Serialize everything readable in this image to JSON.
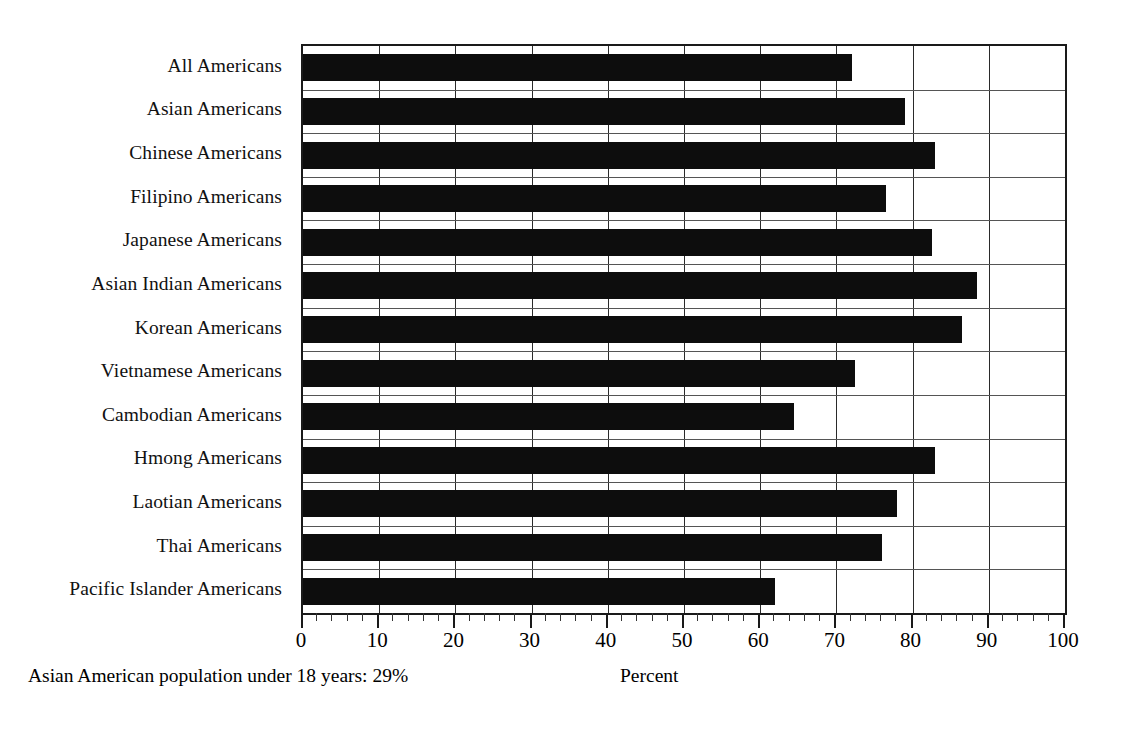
{
  "chart_data": {
    "type": "bar",
    "orientation": "horizontal",
    "title": "",
    "xlabel": "Percent",
    "ylabel": "",
    "xlim": [
      0,
      100
    ],
    "xticks": [
      0,
      10,
      20,
      30,
      40,
      50,
      60,
      70,
      80,
      90,
      100
    ],
    "xtick_labels": [
      "0",
      "10",
      "20",
      "30",
      "40",
      "50",
      "60",
      "70",
      "80",
      "90",
      "100"
    ],
    "minor_tick_step": 2,
    "grid": "vertical-and-category",
    "legend": "none",
    "bar_color": "#0d0d0d",
    "categories": [
      "All Americans",
      "Asian Americans",
      "Chinese Americans",
      "Filipino Americans",
      "Japanese Americans",
      "Asian Indian Americans",
      "Korean Americans",
      "Vietnamese Americans",
      "Cambodian Americans",
      "Hmong Americans",
      "Laotian Americans",
      "Thai Americans",
      "Pacific Islander Americans"
    ],
    "values": [
      72,
      79,
      83,
      76.5,
      82.5,
      88.5,
      86.5,
      72.5,
      64.5,
      83,
      78,
      76,
      62
    ],
    "annotations": [
      "Asian American population under 18 years: 29%"
    ]
  },
  "footnote": "Asian American population under 18 years: 29%",
  "axis_title": "Percent"
}
